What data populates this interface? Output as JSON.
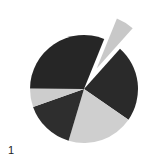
{
  "chart_data": {
    "type": "pie",
    "title": "",
    "panel_label": "1",
    "start_angle_deg": 270,
    "direction": "clockwise",
    "slices": [
      {
        "label": "",
        "value": 5.5,
        "color": "#c8c8c8",
        "exploded": true
      },
      {
        "label": "",
        "value": 23.0,
        "color": "#2a2a2a",
        "exploded": false
      },
      {
        "label": "",
        "value": 20.0,
        "color": "#cfcfcf",
        "exploded": false
      },
      {
        "label": "",
        "value": 15.0,
        "color": "#2e2e2e",
        "exploded": false
      },
      {
        "label": "",
        "value": 5.5,
        "color": "#cdcdcd",
        "exploded": false
      },
      {
        "label": "",
        "value": 31.0,
        "color": "#262626",
        "exploded": false
      }
    ],
    "legend": "none",
    "values_unit": "percent (estimated)"
  },
  "geometry": {
    "cx": 84,
    "cy": 89,
    "r": 54,
    "first_slice_start_deg": 22,
    "explode_offset": 24
  }
}
